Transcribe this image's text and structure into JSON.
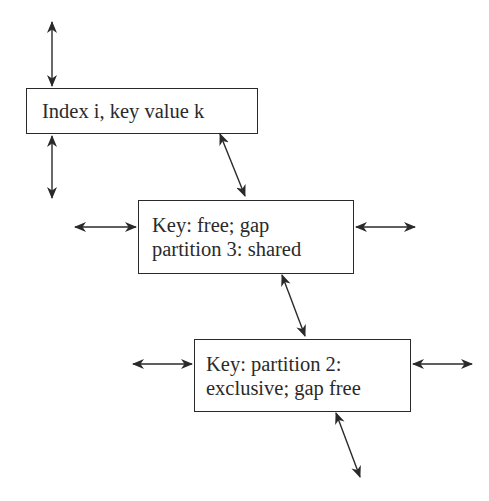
{
  "diagram": {
    "type": "lock-state diagram",
    "stroke_color": "#2a2a2a",
    "background": "#ffffff",
    "nodes": [
      {
        "id": "box1",
        "lines": [
          "Index i, key value k"
        ]
      },
      {
        "id": "box2",
        "lines": [
          "Key: free; gap",
          "partition 3: shared"
        ]
      },
      {
        "id": "box3",
        "lines": [
          "Key: partition 2:",
          "exclusive; gap free"
        ]
      }
    ],
    "edges": [
      {
        "name": "arrow-box1-up",
        "kind": "double-headed",
        "x1": 52,
        "y1": 22,
        "x2": 52,
        "y2": 86
      },
      {
        "name": "arrow-box1-down",
        "kind": "double-headed",
        "x1": 52,
        "y1": 136,
        "x2": 52,
        "y2": 198
      },
      {
        "name": "arrow-box1-to-box2",
        "kind": "double-headed",
        "x1": 220,
        "y1": 134,
        "x2": 245,
        "y2": 196
      },
      {
        "name": "arrow-box2-left",
        "kind": "double-headed",
        "x1": 75,
        "y1": 227,
        "x2": 136,
        "y2": 227
      },
      {
        "name": "arrow-box2-right",
        "kind": "double-headed",
        "x1": 356,
        "y1": 227,
        "x2": 415,
        "y2": 227
      },
      {
        "name": "arrow-box2-to-box3",
        "kind": "double-headed",
        "x1": 282,
        "y1": 275,
        "x2": 305,
        "y2": 336
      },
      {
        "name": "arrow-box3-left",
        "kind": "double-headed",
        "x1": 133,
        "y1": 364,
        "x2": 192,
        "y2": 364
      },
      {
        "name": "arrow-box3-right",
        "kind": "double-headed",
        "x1": 413,
        "y1": 364,
        "x2": 472,
        "y2": 364
      },
      {
        "name": "arrow-box3-down",
        "kind": "double-headed",
        "x1": 336,
        "y1": 413,
        "x2": 360,
        "y2": 477
      }
    ]
  }
}
